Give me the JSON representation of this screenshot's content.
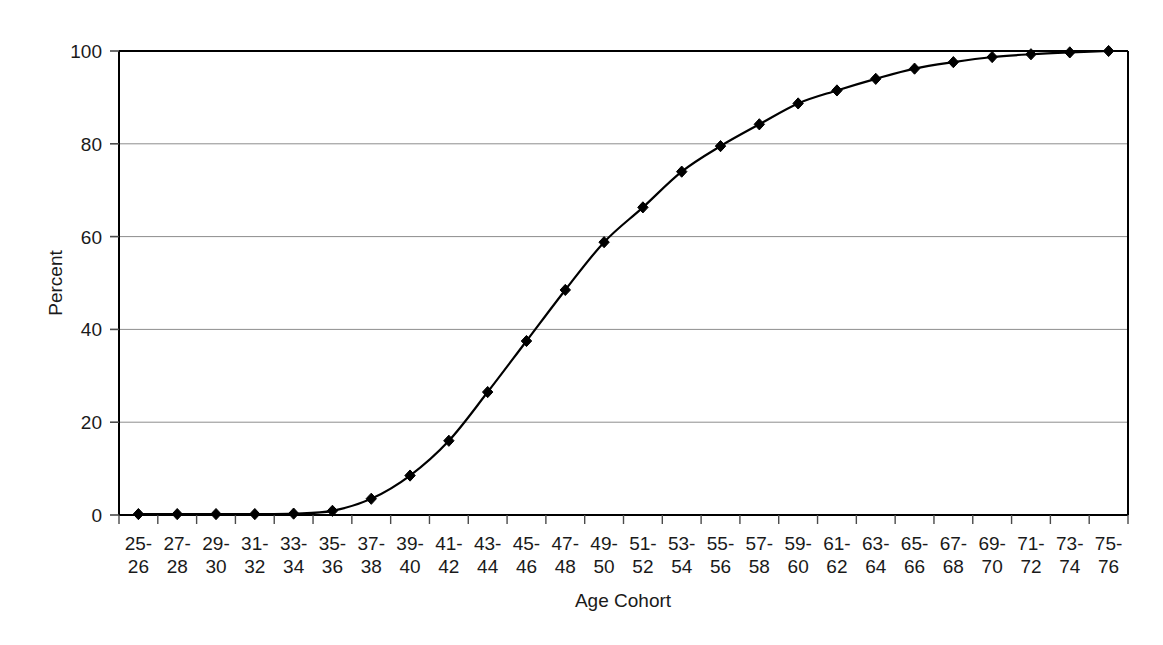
{
  "chart_data": {
    "type": "line",
    "title": "",
    "xlabel": "Age Cohort",
    "ylabel": "Percent",
    "ylim": [
      0,
      100
    ],
    "yticks": [
      0,
      20,
      40,
      60,
      80,
      100
    ],
    "ytick_labels": [
      "0",
      "20",
      "40",
      "60",
      "80",
      "100"
    ],
    "grid": true,
    "grid_axis": "y",
    "legend": false,
    "legend_position": "none",
    "marker": "diamond",
    "line_color": "#000000",
    "grid_color": "#8d8d8d",
    "categories": [
      "25-26",
      "27-28",
      "29-30",
      "31-32",
      "33-34",
      "35-36",
      "37-38",
      "39-40",
      "41-42",
      "43-44",
      "45-46",
      "47-48",
      "49-50",
      "51-52",
      "53-54",
      "55-56",
      "57-58",
      "59-60",
      "61-62",
      "63-64",
      "65-66",
      "67-68",
      "69-70",
      "71-72",
      "73-74",
      "75-76"
    ],
    "category_lines": [
      [
        "25-",
        "26"
      ],
      [
        "27-",
        "28"
      ],
      [
        "29-",
        "30"
      ],
      [
        "31-",
        "32"
      ],
      [
        "33-",
        "34"
      ],
      [
        "35-",
        "36"
      ],
      [
        "37-",
        "38"
      ],
      [
        "39-",
        "40"
      ],
      [
        "41-",
        "42"
      ],
      [
        "43-",
        "44"
      ],
      [
        "45-",
        "46"
      ],
      [
        "47-",
        "48"
      ],
      [
        "49-",
        "50"
      ],
      [
        "51-",
        "52"
      ],
      [
        "53-",
        "54"
      ],
      [
        "55-",
        "56"
      ],
      [
        "57-",
        "58"
      ],
      [
        "59-",
        "60"
      ],
      [
        "61-",
        "62"
      ],
      [
        "63-",
        "64"
      ],
      [
        "65-",
        "66"
      ],
      [
        "67-",
        "68"
      ],
      [
        "69-",
        "70"
      ],
      [
        "71-",
        "72"
      ],
      [
        "73-",
        "74"
      ],
      [
        "75-",
        "76"
      ]
    ],
    "values": [
      0.2,
      0.2,
      0.2,
      0.2,
      0.3,
      0.9,
      3.5,
      8.5,
      16.0,
      26.5,
      37.5,
      48.5,
      58.8,
      66.3,
      74.0,
      79.5,
      84.2,
      88.7,
      91.5,
      94.0,
      96.2,
      97.6,
      98.7,
      99.3,
      99.7,
      100.0
    ],
    "series": [
      {
        "name": "Percent",
        "values": [
          0.2,
          0.2,
          0.2,
          0.2,
          0.3,
          0.9,
          3.5,
          8.5,
          16.0,
          26.5,
          37.5,
          48.5,
          58.8,
          66.3,
          74.0,
          79.5,
          84.2,
          88.7,
          91.5,
          94.0,
          96.2,
          97.6,
          98.7,
          99.3,
          99.7,
          100.0
        ]
      }
    ]
  }
}
